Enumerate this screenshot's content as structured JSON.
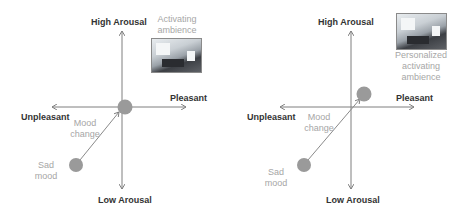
{
  "panels": [
    {
      "id": "left",
      "axes": {
        "top": "High Arousal",
        "bottom": "Low Arousal",
        "left": "Unpleasant",
        "right": "Pleasant"
      },
      "ambience_label_lines": [
        "Activating",
        "ambience"
      ],
      "mood_change_lines": [
        "Mood",
        "change"
      ],
      "sad_mood_lines": [
        "Sad",
        "mood"
      ]
    },
    {
      "id": "right",
      "axes": {
        "top": "High Arousal",
        "bottom": "Low Arousal",
        "left": "Unpleasant",
        "right": "Pleasant"
      },
      "ambience_label_lines": [
        "Personalized",
        "activating",
        "ambience"
      ],
      "mood_change_lines": [
        "Mood",
        "change"
      ],
      "sad_mood_lines": [
        "Sad",
        "mood"
      ]
    }
  ],
  "colors": {
    "axis": "#7f7f7f",
    "circle": "#9a9a9a",
    "label_bold": "#333333",
    "label_grey": "#a6a6a6"
  }
}
